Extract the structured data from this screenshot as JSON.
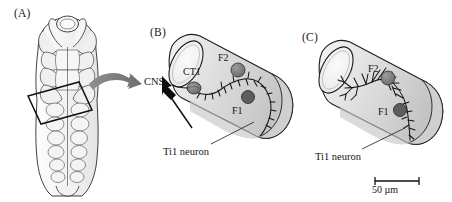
{
  "figure": {
    "background_color": "#ffffff",
    "ink_color": "#141414",
    "cell_fill_color": "#7b7b7b",
    "cell_fill_light": "#8d8d8d",
    "limb_fill_color": "#e2e2e2",
    "limb_shadow_color": "#bdbdbd",
    "arrow_gray_color": "#7e7e7e"
  },
  "panels": [
    {
      "id": "A",
      "label": "(A)",
      "description": "grasshopper embryo dorsal view with boxed limb bud region",
      "callout_box": "rotated-rectangle",
      "arrow": "gray-curved-arrow-right"
    },
    {
      "id": "B",
      "label": "(B)",
      "description": "limb bud cylinder with Ti1 neuron growth cone extending toward CNS",
      "annotations": {
        "cns": "CNS",
        "ct1": "CT1",
        "f2": "F2",
        "f1": "F1",
        "neuron": "Ti1 neuron"
      },
      "guidepost_cells": [
        "CT1",
        "F2",
        "F1"
      ]
    },
    {
      "id": "C",
      "label": "(C)",
      "description": "limb bud cylinder with branched Ti1 neuron filopodia contacting F1 and F2",
      "annotations": {
        "f2": "F2",
        "f1": "F1",
        "neuron": "Ti1 neuron",
        "scale_bar": "50 µm"
      },
      "guidepost_cells": [
        "F2",
        "F1"
      ],
      "scale_bar_value": "50 µm"
    }
  ]
}
